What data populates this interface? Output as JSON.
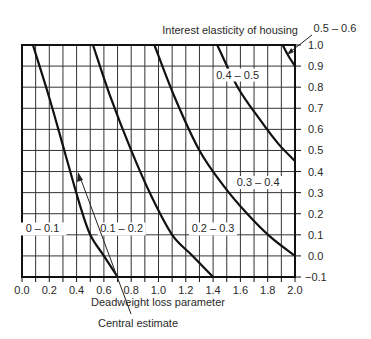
{
  "chart_data": {
    "type": "line",
    "title": "",
    "xlabel": "Deadweight loss parameter",
    "ylabel": "",
    "xlim": [
      0.0,
      2.0
    ],
    "ylim": [
      -0.1,
      1.0
    ],
    "grid": true,
    "y_axis_position": "right",
    "x_ticks": [
      "0.0",
      "0.2",
      "0.4",
      "0.6",
      "0.8",
      "1.0",
      "1.2",
      "1.4",
      "1.6",
      "1.8",
      "2.0"
    ],
    "y_ticks": [
      "1.0",
      "0.9",
      "0.8",
      "0.7",
      "0.6",
      "0.5",
      "0.4",
      "0.3",
      "0.2",
      "0.1",
      "0.0",
      "−0.1"
    ],
    "legend_title": "Interest elasticity of housing",
    "regions": [
      {
        "label": "0 – 0.1",
        "x": 0.15,
        "y": 0.13
      },
      {
        "label": "0.1 – 0.2",
        "x": 0.73,
        "y": 0.13
      },
      {
        "label": "0.2 – 0.3",
        "x": 1.4,
        "y": 0.13
      },
      {
        "label": "0.3 – 0.4",
        "x": 1.73,
        "y": 0.35
      },
      {
        "label": "0.4 – 0.5",
        "x": 1.58,
        "y": 0.86
      },
      {
        "label": "0.5 – 0.6",
        "x": 2.2,
        "y": 1.06
      }
    ],
    "series": [
      {
        "name": "boundary 0.1",
        "points": [
          [
            0.08,
            1.0
          ],
          [
            0.2,
            0.75
          ],
          [
            0.31,
            0.5
          ],
          [
            0.42,
            0.25
          ],
          [
            0.5,
            0.1
          ],
          [
            0.6,
            0.0
          ],
          [
            0.7,
            -0.1
          ]
        ]
      },
      {
        "name": "boundary 0.2",
        "points": [
          [
            0.52,
            1.0
          ],
          [
            0.65,
            0.75
          ],
          [
            0.8,
            0.5
          ],
          [
            0.95,
            0.28
          ],
          [
            1.1,
            0.1
          ],
          [
            1.25,
            0.0
          ],
          [
            1.4,
            -0.1
          ]
        ]
      },
      {
        "name": "boundary 0.3",
        "points": [
          [
            0.97,
            1.0
          ],
          [
            1.12,
            0.75
          ],
          [
            1.3,
            0.5
          ],
          [
            1.48,
            0.33
          ],
          [
            1.65,
            0.2
          ],
          [
            1.82,
            0.09
          ],
          [
            2.0,
            0.0
          ]
        ]
      },
      {
        "name": "boundary 0.4",
        "points": [
          [
            1.43,
            1.0
          ],
          [
            1.58,
            0.8
          ],
          [
            1.75,
            0.64
          ],
          [
            1.88,
            0.53
          ],
          [
            2.0,
            0.45
          ]
        ]
      },
      {
        "name": "boundary 0.5",
        "points": [
          [
            1.91,
            1.0
          ],
          [
            1.95,
            0.95
          ],
          [
            2.0,
            0.9
          ]
        ]
      }
    ],
    "annotations": [
      {
        "text": "Central estimate",
        "arrow_to": [
          0.33,
          0.36
        ]
      },
      {
        "text": "0.5 – 0.6",
        "arrow_to": [
          1.95,
          0.96
        ]
      }
    ]
  }
}
